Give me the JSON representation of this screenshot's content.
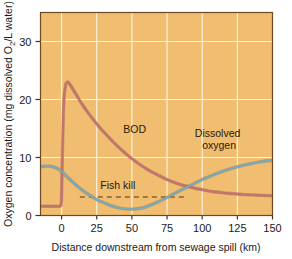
{
  "figure": {
    "name": "oxygen-sag-curve",
    "background_color": "#ffffff",
    "plot_background_color": "#f0bd71",
    "plot_border_color": "#6b4a22",
    "gridline_color": "#fdf6e6"
  },
  "chart_data": {
    "type": "line",
    "title": "",
    "xlabel": "Distance downstream from sewage spill (km)",
    "ylabel": "Oxygen concentration (mg dissolved O₂/L water)",
    "ylabel_parts": {
      "before": "Oxygen concentration (mg dissolved O",
      "subscript": "2",
      "after": "/L water)"
    },
    "xlim": [
      -15,
      150
    ],
    "ylim": [
      0,
      35
    ],
    "xticks": [
      0,
      25,
      50,
      75,
      100,
      125,
      150
    ],
    "xtick_labels": [
      "0",
      "25",
      "50",
      "75",
      "100",
      "125",
      "150"
    ],
    "yticks": [
      0,
      10,
      20,
      30
    ],
    "ytick_labels": [
      "0",
      "10",
      "20",
      "30"
    ],
    "grid": true,
    "grid_axis": "both",
    "legend_position": "inline-annotations",
    "series": [
      {
        "name": "BOD",
        "label": "BOD",
        "color": "#c4736e",
        "label_x": 52,
        "label_y": 14.2,
        "x": [
          -15,
          -10,
          -5,
          -1.5,
          -0.5,
          0,
          0.6,
          1.2,
          2,
          3,
          4,
          5,
          7,
          10,
          14,
          18,
          22,
          26,
          30,
          35,
          40,
          45,
          50,
          55,
          60,
          65,
          70,
          75,
          80,
          85,
          90,
          95,
          100,
          105,
          110,
          115,
          120,
          125,
          130,
          135,
          140,
          145,
          150
        ],
        "y": [
          1.6,
          1.6,
          1.6,
          1.6,
          1.8,
          3.5,
          11.0,
          17.5,
          21.0,
          22.6,
          23.0,
          22.9,
          22.2,
          21.0,
          19.4,
          18.0,
          16.7,
          15.5,
          14.4,
          13.1,
          11.9,
          10.8,
          9.8,
          8.9,
          8.1,
          7.4,
          6.8,
          6.2,
          5.7,
          5.3,
          5.0,
          4.7,
          4.45,
          4.2,
          4.05,
          3.9,
          3.8,
          3.7,
          3.6,
          3.55,
          3.5,
          3.45,
          3.4
        ]
      },
      {
        "name": "Dissolved oxygen",
        "label": "Dissolved oxygen",
        "label_line1": "Dissolved",
        "label_line2": "oxygen",
        "color": "#7fa8b4",
        "label_x": 112,
        "label_y": 13.5,
        "x": [
          -15,
          -12,
          -9,
          -6,
          -3,
          0,
          3,
          6,
          10,
          14,
          18,
          22,
          26,
          30,
          35,
          40,
          45,
          50,
          55,
          60,
          65,
          70,
          75,
          80,
          85,
          90,
          95,
          100,
          105,
          110,
          115,
          120,
          125,
          130,
          135,
          140,
          145,
          150
        ],
        "y": [
          8.4,
          8.5,
          8.5,
          8.4,
          8.1,
          7.6,
          6.9,
          6.2,
          5.3,
          4.5,
          3.8,
          3.2,
          2.6,
          2.2,
          1.7,
          1.35,
          1.15,
          1.1,
          1.2,
          1.5,
          1.95,
          2.5,
          3.1,
          3.75,
          4.4,
          5.0,
          5.6,
          6.2,
          6.7,
          7.2,
          7.65,
          8.05,
          8.4,
          8.7,
          8.95,
          9.2,
          9.4,
          9.5
        ]
      }
    ],
    "annotations": [
      {
        "name": "fish-kill",
        "label": "Fish kill",
        "type": "dashed-hline",
        "y": 3.2,
        "x_start": 13,
        "x_end": 87,
        "color": "#8a6326",
        "label_x": 40,
        "label_y": 4.6
      }
    ]
  }
}
